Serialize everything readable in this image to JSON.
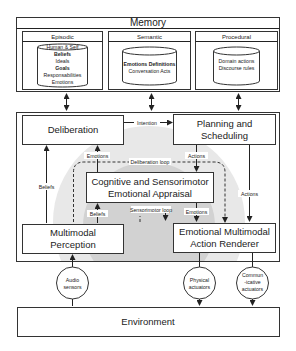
{
  "memory": {
    "title": "Memory",
    "episodic": {
      "title": "Episodic",
      "items": [
        "Human & Self",
        "Beliefs",
        "Ideals",
        "Goals",
        "Responsabilities",
        "Emotions"
      ]
    },
    "semantic": {
      "title": "Semantic",
      "items": [
        "Emotions Definitions",
        "Conversation Acts"
      ]
    },
    "procedural": {
      "title": "Procedural",
      "items": [
        "Domain actions",
        "Discourse rules"
      ]
    }
  },
  "modules": {
    "deliberation": "Deliberation",
    "planning": [
      "Planning and",
      "Scheduling"
    ],
    "appraisal": [
      "Cognitive and Sensorimotor",
      "Emotional Appraisal"
    ],
    "perception": [
      "Multimodal",
      "Perception"
    ],
    "renderer": [
      "Emotional Multimodal",
      "Action Renderer"
    ]
  },
  "edges": {
    "intention": "Intention",
    "emotions_up": "Emotions",
    "actions_down": "Actions",
    "beliefs_left": "Beliefs",
    "deliberation_loop": "Deliberation loop",
    "beliefs_lower": "Beliefs",
    "sensorimotor_loop": "Sensorimotor loop",
    "emotions_lower": "Emotions",
    "actions_right": "Actions"
  },
  "io": {
    "audio": [
      "Audio",
      "sensors"
    ],
    "physical": [
      "Physical",
      "actuators"
    ],
    "communicative": [
      "Commun",
      "-icative",
      "actuators"
    ]
  },
  "environment": "Environment",
  "colors": {
    "outer_halo": "#e8e8e8",
    "inner_halo": "#d0d0d0",
    "stroke": "#333333"
  }
}
